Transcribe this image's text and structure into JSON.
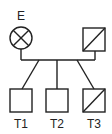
{
  "diagram": {
    "type": "pedigree",
    "stroke_color": "#222222",
    "background": "#ffffff",
    "parents": [
      {
        "id": "E",
        "label": "E",
        "shape": "circle",
        "marking": "x-cross",
        "sex": "female"
      },
      {
        "id": "father",
        "label": "",
        "shape": "square",
        "marking": "diagonal",
        "sex": "male"
      }
    ],
    "children": [
      {
        "id": "T1",
        "label": "T1",
        "shape": "square",
        "marking": "none",
        "sex": "male"
      },
      {
        "id": "T2",
        "label": "T2",
        "shape": "square",
        "marking": "none",
        "sex": "male"
      },
      {
        "id": "T3",
        "label": "T3",
        "shape": "square",
        "marking": "diagonal",
        "sex": "male"
      }
    ]
  }
}
